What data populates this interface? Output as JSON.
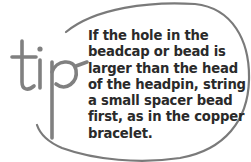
{
  "callout": {
    "label": "tip",
    "lines": [
      "If the hole in the",
      "beadcap or bead is",
      "larger than the head",
      "of the headpin, string",
      "a small spacer bead",
      "first, as in the copper",
      "bracelet."
    ],
    "colors": {
      "outline": "#7a7a7a",
      "label": "#808080",
      "text": "#2a2a2a",
      "background": "#ffffff"
    }
  }
}
